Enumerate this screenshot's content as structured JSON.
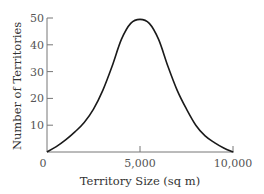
{
  "chart_data": {
    "type": "line",
    "title": "",
    "xlabel": "Territory Size (sq m)",
    "ylabel": "Number of Territories",
    "xlim": [
      0,
      10000
    ],
    "ylim": [
      0,
      50
    ],
    "x_ticks": [
      0,
      5000,
      10000
    ],
    "x_tick_labels": [
      "0",
      "5,000",
      "10,000"
    ],
    "y_ticks": [
      10,
      20,
      30,
      40,
      50
    ],
    "y_tick_labels": [
      "10",
      "20",
      "30",
      "40",
      "50"
    ],
    "grid": false,
    "legend": null,
    "series": [
      {
        "name": "Territories",
        "x": [
          0,
          500,
          1000,
          1500,
          2000,
          2500,
          3000,
          3500,
          4000,
          4500,
          5000,
          5500,
          6000,
          6500,
          7000,
          7500,
          8000,
          8500,
          9000,
          9500,
          10000
        ],
        "values": [
          0,
          2,
          4.5,
          7.5,
          11,
          16,
          23,
          32,
          42,
          48,
          49.5,
          48,
          42,
          32,
          23,
          16,
          10,
          6,
          3.5,
          1.5,
          0
        ]
      }
    ]
  },
  "colors": {
    "curve": "#1a1a1a",
    "axis": "#777777",
    "text": "#333333"
  }
}
